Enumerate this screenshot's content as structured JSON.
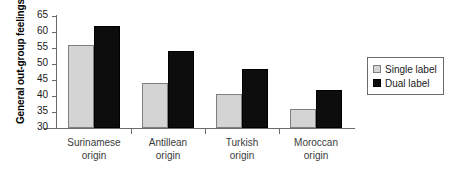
{
  "chart_data": {
    "type": "bar",
    "title": "",
    "xlabel": "",
    "ylabel": "General out-group feelings",
    "ylim": [
      30,
      65
    ],
    "yticks": [
      30,
      35,
      40,
      45,
      50,
      55,
      60,
      65
    ],
    "grid": false,
    "legend_position": "right",
    "categories": [
      "Surinamese origin",
      "Antillean origin",
      "Turkish origin",
      "Moroccan origin"
    ],
    "category_lines": [
      [
        "Surinamese",
        "origin"
      ],
      [
        "Antillean",
        "origin"
      ],
      [
        "Turkish",
        "origin"
      ],
      [
        "Moroccan",
        "origin"
      ]
    ],
    "series": [
      {
        "name": "Single label",
        "color": "#d4d4d4",
        "values": [
          56,
          44,
          40.5,
          36
        ]
      },
      {
        "name": "Dual label",
        "color": "#0d0d0d",
        "values": [
          62,
          54,
          48.5,
          42
        ]
      }
    ]
  },
  "axis": {
    "y_title": "General out-group feelings",
    "tick_labels": [
      "65",
      "60",
      "55",
      "50",
      "45",
      "40",
      "35",
      "30"
    ]
  },
  "legend": {
    "items": [
      {
        "label": "Single label",
        "swatch": "single-label-swatch"
      },
      {
        "label": "Dual label",
        "swatch": "dual-label-swatch"
      }
    ]
  },
  "colors": {
    "single_label_fill": "#d4d4d4",
    "single_label_border": "#808080",
    "dual_label_fill": "#0d0d0d",
    "axis": "#6b6b6b",
    "text": "#1a1a1a",
    "background": "#ffffff"
  }
}
